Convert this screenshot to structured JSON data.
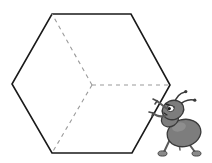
{
  "figure": {
    "background_color": "#ffffff",
    "width": 212,
    "height": 163
  },
  "hexagon": {
    "name": "hexagon-outline",
    "stroke_color": "#1a1a1a",
    "stroke_width": 1.6,
    "fill": "none",
    "vertices": [
      {
        "label": "top-left",
        "x": 52,
        "y": 14
      },
      {
        "label": "top-right",
        "x": 131,
        "y": 14
      },
      {
        "label": "right",
        "x": 170,
        "y": 85
      },
      {
        "label": "bottom-right",
        "x": 132,
        "y": 153
      },
      {
        "label": "bottom-left",
        "x": 52,
        "y": 153
      },
      {
        "label": "left",
        "x": 12,
        "y": 84
      }
    ],
    "center": {
      "x": 92,
      "y": 85
    }
  },
  "interior_lines": {
    "name": "cube-interior-dashed-lines",
    "stroke_color": "#9a9a9a",
    "stroke_width": 1.1,
    "dash_pattern": "4 4",
    "segments": [
      {
        "label": "center-to-top-left",
        "from": {
          "x": 92,
          "y": 85
        },
        "to": {
          "x": 52,
          "y": 14
        }
      },
      {
        "label": "center-to-bottom-left",
        "from": {
          "x": 92,
          "y": 85
        },
        "to": {
          "x": 52,
          "y": 153
        }
      },
      {
        "label": "center-to-right",
        "from": {
          "x": 92,
          "y": 85
        },
        "to": {
          "x": 170,
          "y": 85
        }
      }
    ]
  },
  "ant": {
    "name": "cartoon-ant",
    "pose": "pushing-left",
    "body_fill": "#8a8a8a",
    "body_shade": "#6e6e6e",
    "outline_color": "#3a3a3a",
    "eye_white": "#ffffff",
    "pupil_color": "#1a1a1a",
    "parts": [
      "abdomen",
      "thorax",
      "head",
      "antenna-left",
      "antenna-right",
      "arm-upper",
      "arm-lower",
      "leg-front",
      "leg-rear",
      "foot-front",
      "foot-rear",
      "eye"
    ],
    "position": {
      "x": 152,
      "y": 92,
      "width": 58,
      "height": 68
    }
  }
}
